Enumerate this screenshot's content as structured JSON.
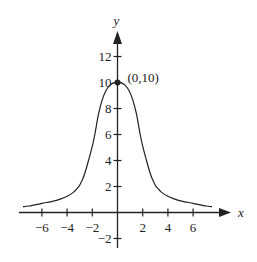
{
  "chart_data": {
    "type": "line",
    "title": "",
    "xlabel": "x",
    "ylabel": "y",
    "xlim": [
      -7.8,
      8.5
    ],
    "ylim": [
      -2.8,
      14.0
    ],
    "grid": false,
    "x_ticks": [
      -6,
      -4,
      -2,
      2,
      4,
      6
    ],
    "x_tick_labels": [
      "−6",
      "−4",
      "−2",
      "2",
      "4",
      "6"
    ],
    "y_ticks": [
      -2,
      2,
      4,
      6,
      8,
      10,
      12
    ],
    "y_tick_labels": [
      "−2",
      "2",
      "4",
      "6",
      "8",
      "10",
      "12"
    ],
    "annotations": [
      {
        "x": 0,
        "y": 10,
        "text": "(0,10)",
        "marker": "dot"
      }
    ],
    "series": [
      {
        "name": "f(x)",
        "x": [
          -7.5,
          -7,
          -6,
          -5,
          -4.5,
          -4,
          -3.5,
          -3.2,
          -3,
          -2.8,
          -2.6,
          -2.3,
          -2,
          -1.8,
          -1.5,
          -1.2,
          -0.9,
          -0.6,
          -0.3,
          0,
          0.3,
          0.6,
          0.9,
          1.2,
          1.5,
          1.8,
          2,
          2.3,
          2.6,
          2.8,
          3,
          3.2,
          3.5,
          4,
          4.5,
          5,
          6,
          7,
          7.5
        ],
        "values": [
          0.45,
          0.5,
          0.7,
          0.9,
          1.05,
          1.25,
          1.55,
          1.85,
          2.1,
          2.5,
          3.0,
          4.0,
          5.1,
          6.0,
          7.6,
          8.7,
          9.4,
          9.8,
          9.97,
          10,
          9.97,
          9.8,
          9.4,
          8.7,
          7.6,
          6.0,
          5.1,
          4.0,
          3.0,
          2.5,
          2.1,
          1.85,
          1.55,
          1.25,
          1.05,
          0.9,
          0.7,
          0.5,
          0.45
        ]
      }
    ]
  }
}
